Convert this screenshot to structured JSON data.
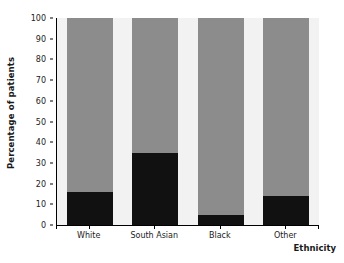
{
  "chart_data": {
    "type": "bar",
    "subtype": "stacked-100-percent",
    "title": "",
    "xlabel": "Ethnicity",
    "ylabel": "Percentage of patients",
    "categories": [
      "White",
      "South Asian",
      "Black",
      "Other"
    ],
    "ylim": [
      0,
      100
    ],
    "yticks": [
      0,
      10,
      20,
      30,
      40,
      50,
      60,
      70,
      80,
      90,
      100
    ],
    "ytick_labels": [
      "0",
      "10",
      "20",
      "30",
      "40",
      "50",
      "60",
      "70",
      "80",
      "90",
      "100"
    ],
    "grid": false,
    "legend": "none",
    "series": [
      {
        "name": "lower-segment",
        "color": "#111111",
        "values": [
          16,
          35,
          5,
          14
        ]
      },
      {
        "name": "upper-segment",
        "color": "#8c8c8c",
        "values": [
          84,
          65,
          95,
          86
        ]
      }
    ]
  },
  "colors": {
    "plot_background": "#f2f2f2",
    "axis": "#000000",
    "dark_segment": "#111111",
    "gray_segment": "#8c8c8c",
    "text": "#222222"
  }
}
